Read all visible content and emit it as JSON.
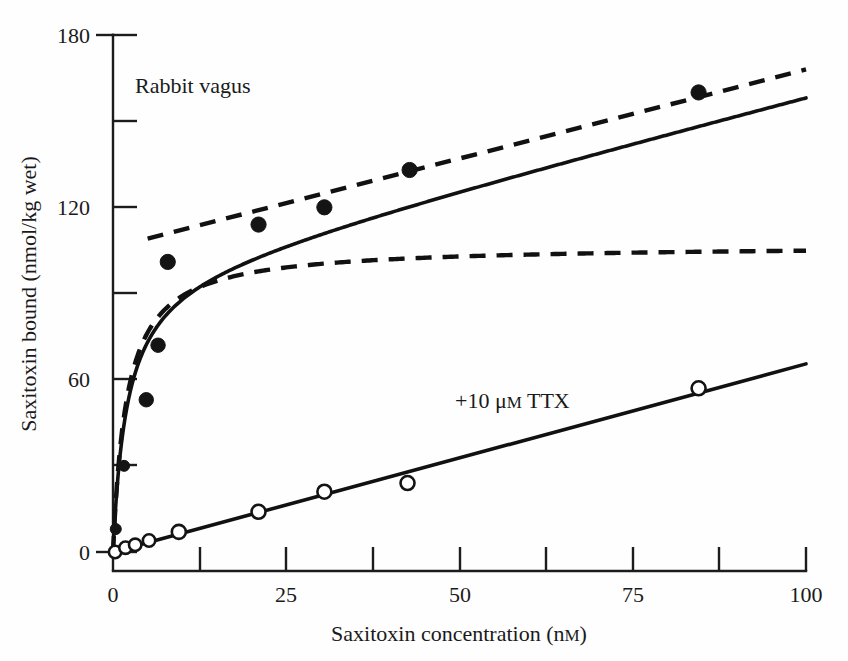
{
  "chart_data": {
    "type": "scatter",
    "title": "",
    "xlabel": "Saxitoxin concentration (nM)",
    "ylabel": "Saxitoxin bound (nmol/kg wet)",
    "xlim": [
      0,
      100
    ],
    "ylim": [
      0,
      180
    ],
    "grid": false,
    "legend": "none",
    "x_ticks": [
      0,
      12.5,
      25,
      37.5,
      50,
      62.5,
      75,
      87.5,
      100
    ],
    "x_tick_labels": [
      "0",
      "",
      "25",
      "",
      "50",
      "",
      "75",
      "",
      "100"
    ],
    "y_ticks": [
      0,
      30,
      60,
      90,
      120,
      150,
      180
    ],
    "y_tick_labels": [
      "0",
      "",
      "60",
      "",
      "120",
      "",
      "180"
    ],
    "annotations": [
      {
        "text": "Rabbit vagus",
        "x": 5.0,
        "y": 160
      },
      {
        "text": "+10 ",
        "x": 50,
        "y": 55
      }
    ],
    "series": [
      {
        "name": "Total saxitoxin bound (control)",
        "marker": "filled-circle",
        "points": [
          {
            "x": 0.4,
            "y": 8
          },
          {
            "x": 1.6,
            "y": 30
          },
          {
            "x": 4.8,
            "y": 53
          },
          {
            "x": 6.5,
            "y": 72
          },
          {
            "x": 7.9,
            "y": 101
          },
          {
            "x": 21.0,
            "y": 114
          },
          {
            "x": 30.5,
            "y": 120
          },
          {
            "x": 42.8,
            "y": 133
          },
          {
            "x": 84.5,
            "y": 160
          }
        ]
      },
      {
        "name": "Nonspecific binding (+10 uM TTX)",
        "marker": "open-circle",
        "points": [
          {
            "x": 0.3,
            "y": 0
          },
          {
            "x": 1.8,
            "y": 1.5
          },
          {
            "x": 3.2,
            "y": 2.5
          },
          {
            "x": 5.2,
            "y": 4
          },
          {
            "x": 9.5,
            "y": 7
          },
          {
            "x": 21.0,
            "y": 14
          },
          {
            "x": 30.5,
            "y": 21
          },
          {
            "x": 42.5,
            "y": 24
          },
          {
            "x": 84.5,
            "y": 57
          }
        ]
      }
    ],
    "fitted_curves": [
      {
        "name": "total-binding-fit",
        "style": "solid",
        "description": "Saturable plus linear total binding fit",
        "model": "Bmax*C/(Kd+C) + m*C",
        "Bmax": 98,
        "Kd": 2.0,
        "m": 0.62
      },
      {
        "name": "saturable-component-fit",
        "style": "dashed",
        "description": "Saturable (specific) binding component plateauing near 105",
        "model": "Bmax*C/(Kd+C)",
        "Bmax": 107,
        "Kd": 2.0
      },
      {
        "name": "linear-plus-offset-fit",
        "style": "dashed",
        "description": "Linear nonspecific component offset by saturable plateau",
        "model": "b + m*C",
        "b": 106,
        "m": 0.62
      },
      {
        "name": "nonspecific-ttx-line",
        "style": "solid",
        "description": "Linear nonspecific binding measured in 10 uM TTX",
        "model": "m*C",
        "m": 0.655
      }
    ]
  },
  "labels": {
    "y_axis_title": "Saxitoxin bound (nmol/kg wet)",
    "x_axis_title": "Saxitoxin concentration (nM)",
    "x_axis_title_main": "Saxitoxin concentration (n",
    "x_axis_title_sc": "M",
    "x_axis_title_tail": ")",
    "preparation_label": "Rabbit vagus",
    "ttx_label_main": "+10 ",
    "ttx_label_mu": "μ",
    "ttx_label_sc": "M",
    "ttx_label_tail": " TTX",
    "ttx_label_full": "+10 μM TTX"
  },
  "ticks": {
    "x": [
      {
        "value": "0",
        "px": 113
      },
      {
        "value": "",
        "px": 200
      },
      {
        "value": "25",
        "px": 286
      },
      {
        "value": "",
        "px": 373
      },
      {
        "value": "50",
        "px": 460
      },
      {
        "value": "",
        "px": 546
      },
      {
        "value": "75",
        "px": 633
      },
      {
        "value": "",
        "px": 719
      },
      {
        "value": "100",
        "px": 806
      }
    ],
    "y": [
      {
        "value": "180",
        "px": 35
      },
      {
        "value": "",
        "px": 121
      },
      {
        "value": "120",
        "px": 207
      },
      {
        "value": "",
        "px": 293
      },
      {
        "value": "60",
        "px": 379
      },
      {
        "value": "",
        "px": 465
      },
      {
        "value": "0",
        "px": 552
      }
    ]
  },
  "colors": {
    "ink": "#141414",
    "background": "#fefefe"
  }
}
